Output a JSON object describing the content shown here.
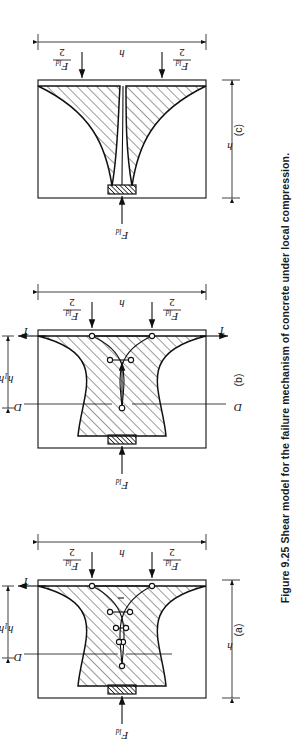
{
  "figure": {
    "number": "Figure 9.25",
    "caption": "Figure 9.25  Shear model for the failure mechanism of concrete under local compression.",
    "caption_text": "Shear model for the failure mechanism of concrete under local compression.",
    "orientation_deg": 90,
    "colors": {
      "ink": "#111111",
      "paper": "#ffffff"
    }
  },
  "panels": [
    {
      "id": "a",
      "label": "(a)",
      "applied_load": "F",
      "applied_load_sub": "ld",
      "reaction_top_num": "F",
      "reaction_top_sub": "ld",
      "reaction_top_den": "2",
      "reaction_bot_num": "F",
      "reaction_bot_sub": "ld",
      "reaction_bot_den": "2",
      "tie_force": "T",
      "strut_label": "D",
      "inner_dim": "h",
      "inner_dim_sub": "1",
      "inner_dim_tail": "h",
      "outer_dim": "h",
      "height_dim": "h",
      "nodes": 9,
      "description": "Fan-shaped strut-and-tie truss with multiple inclined struts and vertical ties"
    },
    {
      "id": "b",
      "label": "(b)",
      "applied_load": "F",
      "applied_load_sub": "ld",
      "reaction_top_num": "F",
      "reaction_top_sub": "ld",
      "reaction_top_den": "2",
      "reaction_bot_num": "F",
      "reaction_bot_sub": "ld",
      "reaction_bot_den": "2",
      "tie_force": "T",
      "strut_label": "D",
      "inner_dim": "h",
      "inner_dim_sub": "1",
      "inner_dim_tail": "h",
      "outer_dim": "h",
      "height_dim": "h",
      "nodes": 5,
      "description": "Simplified truss with single resultant strut arrow and two vertical ties"
    },
    {
      "id": "c",
      "label": "(c)",
      "applied_load": "F",
      "applied_load_sub": "ld",
      "reaction_top_num": "F",
      "reaction_top_sub": "ld",
      "reaction_top_den": "2",
      "reaction_bot_num": "F",
      "reaction_bot_sub": "ld",
      "reaction_bot_den": "2",
      "height_dim": "h",
      "width_dim": "h",
      "nodes": 0,
      "description": "Continuous wedge splitting crack pattern, no discrete truss"
    }
  ]
}
